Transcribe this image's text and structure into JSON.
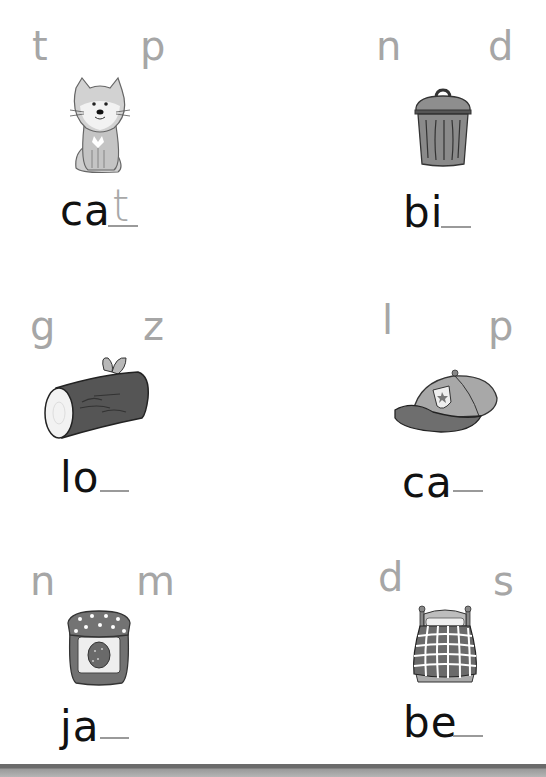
{
  "worksheet": {
    "items": [
      {
        "choices": [
          "t",
          "p"
        ],
        "word_stem": "ca",
        "answer": "t",
        "picture": "cat"
      },
      {
        "choices": [
          "n",
          "d"
        ],
        "word_stem": "bi",
        "answer": "",
        "picture": "trash-bin"
      },
      {
        "choices": [
          "g",
          "z"
        ],
        "word_stem": "lo",
        "answer": "",
        "picture": "log"
      },
      {
        "choices": [
          "l",
          "p"
        ],
        "word_stem": "ca",
        "answer": "",
        "picture": "cap"
      },
      {
        "choices": [
          "n",
          "m"
        ],
        "word_stem": "ja",
        "answer": "",
        "picture": "jam-jar"
      },
      {
        "choices": [
          "d",
          "s"
        ],
        "word_stem": "be",
        "answer": "",
        "picture": "bed"
      }
    ]
  },
  "colors": {
    "choice_letter": "#a6a6a6",
    "word_text": "#111111",
    "blank_line": "#9a9a9a",
    "footer_bar": "#6b6b6b"
  }
}
